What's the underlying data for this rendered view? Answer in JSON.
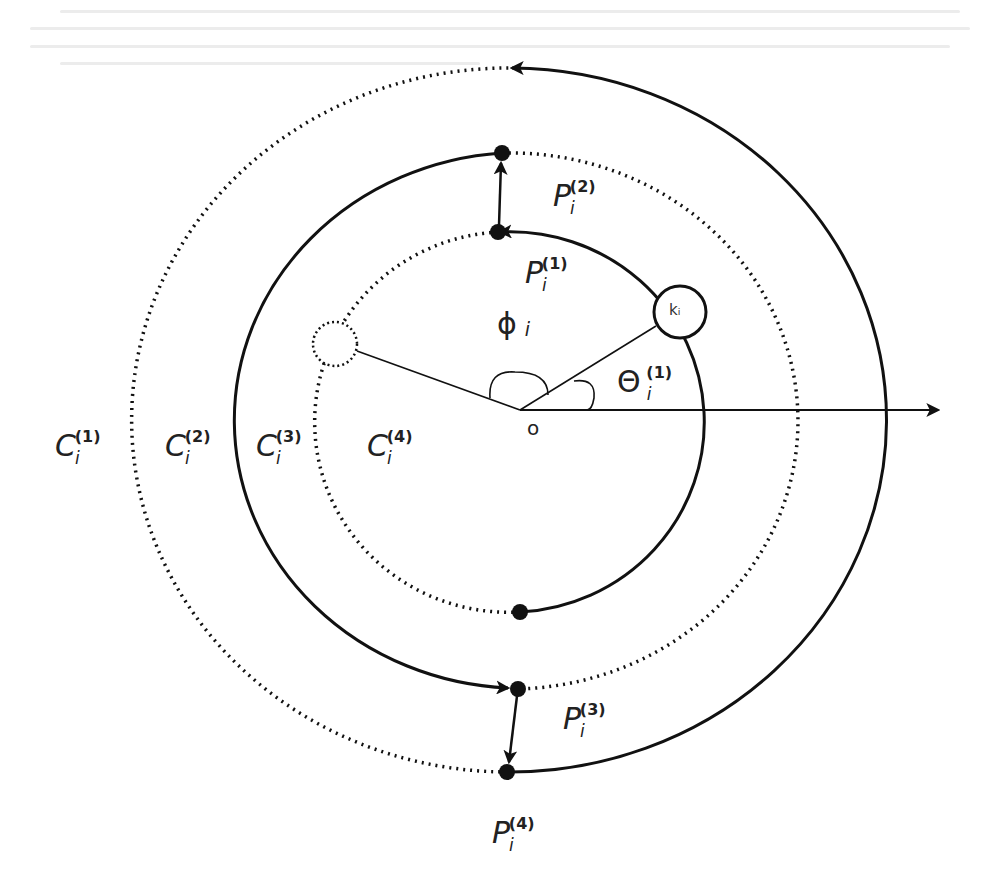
{
  "figure": {
    "background": "#ffffff",
    "stroke_color": "#111111",
    "origin_label": "o",
    "node_label": "kᵢ",
    "angle_labels": {
      "phi": {
        "symbol": "ϕ",
        "sub": "i"
      },
      "theta": {
        "symbol": "Θ",
        "sub": "i",
        "sup": "(1)"
      }
    },
    "circles": [
      {
        "name": "C",
        "sub": "i",
        "sup": "(1)",
        "style": "solid-right/dotted-left"
      },
      {
        "name": "C",
        "sub": "i",
        "sup": "(2)",
        "style": "solid-left/dotted-right"
      },
      {
        "name": "C",
        "sub": "i",
        "sup": "(3)",
        "style": "solid-right/dotted-left"
      },
      {
        "name": "C",
        "sub": "i",
        "sup": "(4)",
        "style": "inner label"
      }
    ],
    "points": [
      {
        "name": "P",
        "sub": "i",
        "sup": "(1)"
      },
      {
        "name": "P",
        "sub": "i",
        "sup": "(2)"
      },
      {
        "name": "P",
        "sub": "i",
        "sup": "(3)"
      },
      {
        "name": "P",
        "sub": "i",
        "sup": "(4)"
      }
    ]
  }
}
